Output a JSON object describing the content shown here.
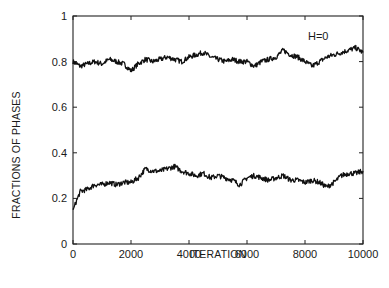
{
  "chart_data": {
    "type": "line",
    "title": "",
    "xlabel": "ITERATION",
    "ylabel": "FRACTIONS OF PHASES",
    "xlim": [
      0,
      10000
    ],
    "ylim": [
      0,
      1
    ],
    "xticks": [
      0,
      2000,
      4000,
      6000,
      8000,
      10000
    ],
    "xtick_labels": [
      "0",
      "2000",
      "4000",
      "6000",
      "8000",
      "10000"
    ],
    "yticks": [
      0,
      0.2,
      0.4,
      0.6,
      0.8,
      1
    ],
    "ytick_labels": [
      "0",
      "0.2",
      "0.4",
      "0.6",
      "0.8",
      "1"
    ],
    "grid": false,
    "legend": null,
    "annotations": [
      {
        "text": "H=0",
        "x": 8500,
        "y": 0.9
      }
    ],
    "x": [
      0,
      250,
      500,
      750,
      1000,
      1250,
      1500,
      1750,
      2000,
      2250,
      2500,
      2750,
      3000,
      3250,
      3500,
      3750,
      4000,
      4250,
      4500,
      4750,
      5000,
      5250,
      5500,
      5750,
      6000,
      6250,
      6500,
      6750,
      7000,
      7250,
      7500,
      7750,
      8000,
      8250,
      8500,
      8750,
      9000,
      9250,
      9500,
      9750,
      10000
    ],
    "series": [
      {
        "name": "upper phase",
        "values": [
          0.8,
          0.78,
          0.79,
          0.8,
          0.79,
          0.81,
          0.8,
          0.79,
          0.76,
          0.79,
          0.81,
          0.8,
          0.81,
          0.82,
          0.81,
          0.8,
          0.82,
          0.83,
          0.84,
          0.82,
          0.81,
          0.8,
          0.81,
          0.8,
          0.8,
          0.78,
          0.8,
          0.81,
          0.82,
          0.85,
          0.83,
          0.82,
          0.8,
          0.78,
          0.8,
          0.82,
          0.83,
          0.84,
          0.85,
          0.86,
          0.84
        ]
      },
      {
        "name": "lower phase",
        "values": [
          0.15,
          0.23,
          0.24,
          0.26,
          0.26,
          0.27,
          0.26,
          0.27,
          0.27,
          0.29,
          0.33,
          0.32,
          0.32,
          0.33,
          0.34,
          0.32,
          0.31,
          0.3,
          0.31,
          0.29,
          0.3,
          0.29,
          0.28,
          0.26,
          0.29,
          0.3,
          0.29,
          0.28,
          0.29,
          0.3,
          0.28,
          0.28,
          0.27,
          0.28,
          0.27,
          0.25,
          0.27,
          0.3,
          0.31,
          0.31,
          0.32
        ]
      }
    ]
  },
  "colors": {
    "line": "#111111",
    "frame": "#222222",
    "background": "#ffffff"
  }
}
